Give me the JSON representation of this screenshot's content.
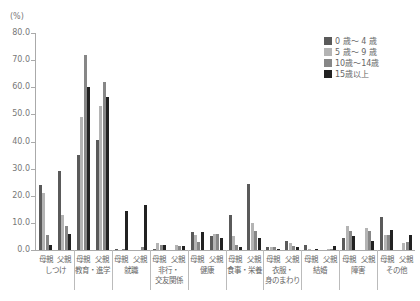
{
  "chart_data": {
    "type": "bar",
    "title": "",
    "ylabel": "(%)",
    "xlabel": "",
    "ylim": [
      0,
      80
    ],
    "yticks": [
      "0.0",
      "10.0",
      "20.0",
      "30.0",
      "40.0",
      "50.0",
      "60.0",
      "70.0",
      "80.0"
    ],
    "grid": false,
    "legend_position": "top-right",
    "categories": [
      "しつけ",
      "教育・進学",
      "就職",
      "非行・\n交友関係",
      "健康",
      "食事・栄養",
      "衣服・\n身のまわり",
      "結婚",
      "障害",
      "その他"
    ],
    "sub_categories": [
      "母親",
      "父親"
    ],
    "series": [
      {
        "name": "0 歳～ 4 歳",
        "color": "#5a5a5a",
        "values": [
          [
            24.0,
            29.0
          ],
          [
            35.0,
            40.5
          ],
          [
            0.5,
            0.0
          ],
          [
            0.5,
            0.0
          ],
          [
            6.5,
            5.0
          ],
          [
            13.0,
            24.5
          ],
          [
            1.0,
            3.5
          ],
          [
            2.0,
            0.0
          ],
          [
            4.5,
            0.0
          ],
          [
            12.0,
            0.0
          ]
        ]
      },
      {
        "name": "5 歳～ 9 歳",
        "color": "#b4b4b4",
        "values": [
          [
            21.0,
            13.0
          ],
          [
            49.0,
            53.0
          ],
          [
            0.0,
            0.0
          ],
          [
            2.5,
            2.0
          ],
          [
            5.5,
            6.0
          ],
          [
            5.0,
            10.0
          ],
          [
            1.0,
            2.5
          ],
          [
            0.3,
            0.5
          ],
          [
            9.0,
            8.0
          ],
          [
            5.5,
            2.5
          ]
        ]
      },
      {
        "name": "10歳～14歳",
        "color": "#878787",
        "values": [
          [
            5.5,
            9.0
          ],
          [
            72.0,
            62.0
          ],
          [
            0.5,
            1.0
          ],
          [
            2.0,
            1.5
          ],
          [
            3.0,
            6.0
          ],
          [
            2.0,
            7.0
          ],
          [
            1.0,
            1.5
          ],
          [
            0.0,
            0.5
          ],
          [
            7.0,
            7.0
          ],
          [
            5.5,
            3.0
          ]
        ]
      },
      {
        "name": "15歳以上",
        "color": "#222222",
        "values": [
          [
            2.0,
            6.0
          ],
          [
            60.0,
            56.5
          ],
          [
            14.5,
            16.5
          ],
          [
            2.0,
            1.5
          ],
          [
            6.5,
            4.5
          ],
          [
            1.0,
            4.5
          ],
          [
            0.5,
            1.0
          ],
          [
            0.5,
            1.5
          ],
          [
            5.0,
            3.5
          ],
          [
            7.5,
            5.5
          ]
        ]
      }
    ]
  }
}
